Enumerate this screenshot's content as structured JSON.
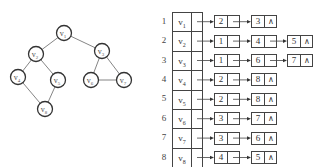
{
  "graph": {
    "nodes": [
      {
        "id": "v1",
        "label": "v",
        "sub": "1",
        "x": 64,
        "y": 33
      },
      {
        "id": "v2",
        "label": "v",
        "sub": "2",
        "x": 36,
        "y": 54
      },
      {
        "id": "v3",
        "label": "v",
        "sub": "3",
        "x": 102,
        "y": 51
      },
      {
        "id": "v4",
        "label": "v",
        "sub": "4",
        "x": 18,
        "y": 77
      },
      {
        "id": "v5",
        "label": "v",
        "sub": "5",
        "x": 58,
        "y": 80
      },
      {
        "id": "v6",
        "label": "v",
        "sub": "6",
        "x": 91,
        "y": 80
      },
      {
        "id": "v7",
        "label": "v",
        "sub": "7",
        "x": 124,
        "y": 80
      },
      {
        "id": "v8",
        "label": "v",
        "sub": "8",
        "x": 45,
        "y": 109
      }
    ],
    "edges": [
      [
        "v1",
        "v2"
      ],
      [
        "v1",
        "v3"
      ],
      [
        "v2",
        "v4"
      ],
      [
        "v2",
        "v5"
      ],
      [
        "v4",
        "v8"
      ],
      [
        "v5",
        "v8"
      ],
      [
        "v3",
        "v6"
      ],
      [
        "v3",
        "v7"
      ],
      [
        "v6",
        "v7"
      ]
    ]
  },
  "adjacency_list": {
    "null_symbol": "∧",
    "rows": [
      {
        "index": "1",
        "vertex": "v",
        "sub": "1",
        "neighbors": [
          "2",
          "3"
        ]
      },
      {
        "index": "2",
        "vertex": "v",
        "sub": "2",
        "neighbors": [
          "1",
          "4",
          "5"
        ]
      },
      {
        "index": "3",
        "vertex": "v",
        "sub": "3",
        "neighbors": [
          "1",
          "6",
          "7"
        ]
      },
      {
        "index": "4",
        "vertex": "v",
        "sub": "4",
        "neighbors": [
          "2",
          "8"
        ]
      },
      {
        "index": "5",
        "vertex": "v",
        "sub": "5",
        "neighbors": [
          "2",
          "8"
        ]
      },
      {
        "index": "6",
        "vertex": "v",
        "sub": "6",
        "neighbors": [
          "3",
          "7"
        ]
      },
      {
        "index": "7",
        "vertex": "v",
        "sub": "7",
        "neighbors": [
          "3",
          "6"
        ]
      },
      {
        "index": "8",
        "vertex": "v",
        "sub": "8",
        "neighbors": [
          "4",
          "5"
        ]
      }
    ]
  }
}
